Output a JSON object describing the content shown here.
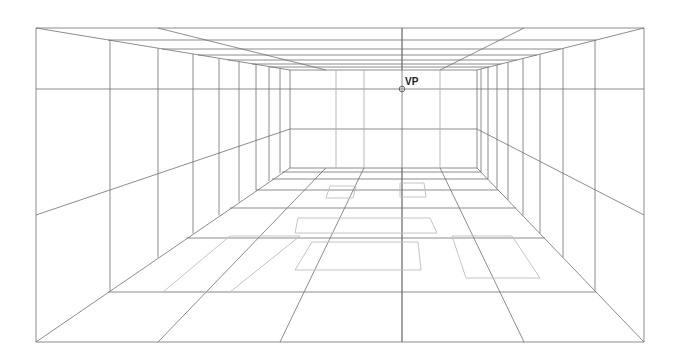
{
  "diagram": {
    "type": "one-point-perspective-room",
    "vanishing_point": {
      "label": "VP",
      "x": 402,
      "y": 89
    },
    "colors": {
      "background": "#ffffff",
      "line": "#6e6e6e",
      "light_line": "#a8a8a8",
      "rug": "#bdbdbd",
      "label": "#222222"
    },
    "outer_frame": {
      "x1": 36,
      "y1": 28,
      "x2": 644,
      "y2": 342
    },
    "back_wall": {
      "x1": 290,
      "y1": 70,
      "x2": 477,
      "y2": 168
    },
    "horizon_y": 89,
    "wall_rail": {
      "front_y_left": 215,
      "front_y_right": 215,
      "back_y": 129
    },
    "left_wall_columns_x": [
      110,
      158,
      193,
      219,
      239,
      256,
      269,
      280
    ],
    "right_wall_columns_x": [
      595,
      563,
      540,
      523,
      508,
      497,
      488,
      481
    ],
    "floor_rows_y": [
      292,
      238,
      208,
      190,
      179,
      172
    ],
    "ceiling_rows_y": [
      40,
      49,
      55,
      60,
      64,
      67
    ],
    "floor_columns_front_x": [
      36,
      158,
      280,
      402,
      524,
      644
    ],
    "ceiling_columns_front_x": [
      158,
      402,
      524
    ],
    "rugs": [
      {
        "name": "rug-back-left",
        "pts": [
          [
            330,
            186
          ],
          [
            356,
            186
          ],
          [
            353,
            198
          ],
          [
            326,
            198
          ]
        ]
      },
      {
        "name": "rug-back-right",
        "pts": [
          [
            400,
            183
          ],
          [
            424,
            183
          ],
          [
            426,
            197
          ],
          [
            400,
            197
          ]
        ]
      },
      {
        "name": "rug-mid-left",
        "pts": [
          [
            298,
            218
          ],
          [
            430,
            218
          ],
          [
            437,
            233
          ],
          [
            295,
            233
          ]
        ]
      },
      {
        "name": "rug-center",
        "pts": [
          [
            312,
            242
          ],
          [
            418,
            242
          ],
          [
            421,
            270
          ],
          [
            295,
            270
          ]
        ]
      },
      {
        "name": "rug-right",
        "pts": [
          [
            452,
            236
          ],
          [
            512,
            236
          ],
          [
            540,
            278
          ],
          [
            466,
            278
          ]
        ]
      },
      {
        "name": "rug-left-large",
        "pts": [
          [
            230,
            236
          ],
          [
            300,
            236
          ],
          [
            230,
            292
          ],
          [
            163,
            292
          ]
        ]
      }
    ]
  }
}
